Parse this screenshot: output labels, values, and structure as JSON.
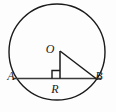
{
  "figure": {
    "type": "geometry-diagram",
    "background_color": "#fdfdfd",
    "stroke_color": "#1a1a1a",
    "labels": {
      "center": "O",
      "left_point": "A",
      "right_point": "B",
      "radius_segment": "R"
    },
    "geometry": {
      "circle": {
        "cx": 57,
        "cy": 52,
        "r": 48
      },
      "center_point": {
        "x": 60,
        "y": 51
      },
      "chord_left": {
        "x": 13,
        "y": 78.5
      },
      "chord_right": {
        "x": 101,
        "y": 78.5
      },
      "foot_of_perpendicular": {
        "x": 60,
        "y": 78.5
      },
      "point_B": {
        "x": 96,
        "y": 78.5
      },
      "right_angle_box": {
        "x": 52,
        "y": 70.5,
        "size": 8
      }
    },
    "label_positions": {
      "O": {
        "x": 50,
        "y": 53
      },
      "A": {
        "x": 11,
        "y": 80
      },
      "B": {
        "x": 97,
        "y": 80
      },
      "R": {
        "x": 52,
        "y": 93
      }
    }
  }
}
